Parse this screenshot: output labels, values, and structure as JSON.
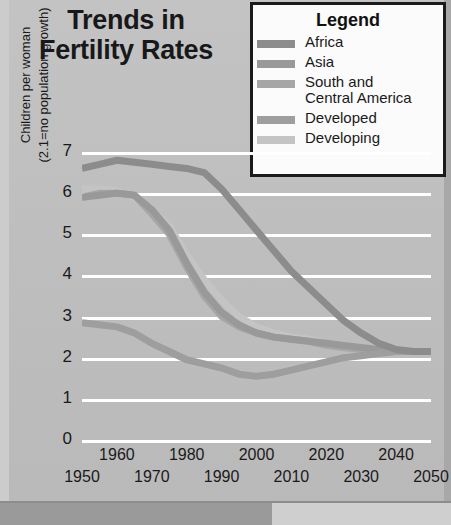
{
  "title": "Trends in Fertility Rates",
  "title_line1": "Trends in",
  "title_line2": "Fertility Rates",
  "legend": {
    "heading": "Legend",
    "items": [
      {
        "label": "Africa",
        "color": "#8c8c8c"
      },
      {
        "label": "Asia",
        "color": "#999999"
      },
      {
        "label": "South and\nCentral America",
        "color": "#a6a6a6"
      },
      {
        "label": "Developed",
        "color": "#9e9e9e"
      },
      {
        "label": "Developing",
        "color": "#c4c4c4"
      }
    ]
  },
  "axes": {
    "ylabel_line1": "Children per woman",
    "ylabel_line2": "(2.1=no population growth)",
    "yticks": [
      "7",
      "6",
      "5",
      "4",
      "3",
      "2",
      "1",
      "0"
    ],
    "xticks_upper": [
      "1960",
      "1980",
      "2000",
      "2020",
      "2040"
    ],
    "xticks_lower": [
      "1950",
      "1970",
      "1990",
      "2010",
      "2030",
      "2050"
    ]
  },
  "colors": {
    "background": "#bfbfbf",
    "gridline": "#ffffff",
    "text": "#1a1a1a",
    "legend_background": "#fbfbfb",
    "legend_border": "#1a1a1a"
  },
  "chart_data": {
    "type": "line",
    "title": "Trends in Fertility Rates",
    "xlabel": "",
    "ylabel": "Children per woman (2.1=no population growth)",
    "xlim": [
      1950,
      2050
    ],
    "ylim": [
      0,
      7
    ],
    "grid": true,
    "legend_position": "top-right",
    "x": [
      1950,
      1955,
      1960,
      1965,
      1970,
      1975,
      1980,
      1985,
      1990,
      1995,
      2000,
      2005,
      2010,
      2015,
      2020,
      2025,
      2030,
      2035,
      2040,
      2045,
      2050
    ],
    "series": [
      {
        "name": "Africa",
        "color": "#8c8c8c",
        "values": [
          6.6,
          6.7,
          6.8,
          6.75,
          6.7,
          6.65,
          6.6,
          6.5,
          6.1,
          5.6,
          5.1,
          4.6,
          4.1,
          3.7,
          3.3,
          2.9,
          2.6,
          2.35,
          2.2,
          2.15,
          2.15
        ]
      },
      {
        "name": "Asia",
        "color": "#999999",
        "values": [
          5.9,
          5.95,
          6.0,
          5.95,
          5.6,
          5.1,
          4.3,
          3.6,
          3.1,
          2.8,
          2.6,
          2.5,
          2.45,
          2.4,
          2.35,
          2.3,
          2.25,
          2.2,
          2.15,
          2.15,
          2.15
        ]
      },
      {
        "name": "South and Central America",
        "color": "#a6a6a6",
        "values": [
          5.9,
          6.0,
          6.0,
          5.95,
          5.5,
          5.0,
          4.2,
          3.5,
          3.0,
          2.75,
          2.6,
          2.5,
          2.45,
          2.4,
          2.3,
          2.25,
          2.2,
          2.18,
          2.15,
          2.15,
          2.15
        ]
      },
      {
        "name": "Developed",
        "color": "#9e9e9e",
        "values": [
          2.85,
          2.8,
          2.75,
          2.6,
          2.35,
          2.15,
          1.95,
          1.85,
          1.75,
          1.6,
          1.55,
          1.6,
          1.7,
          1.8,
          1.9,
          2.0,
          2.05,
          2.1,
          2.15,
          2.15,
          2.15
        ]
      },
      {
        "name": "Developing",
        "color": "#c4c4c4",
        "values": [
          6.1,
          6.1,
          6.05,
          5.9,
          5.6,
          5.2,
          4.5,
          3.9,
          3.4,
          3.0,
          2.75,
          2.6,
          2.5,
          2.45,
          2.35,
          2.3,
          2.25,
          2.2,
          2.15,
          2.15,
          2.15
        ]
      }
    ]
  }
}
